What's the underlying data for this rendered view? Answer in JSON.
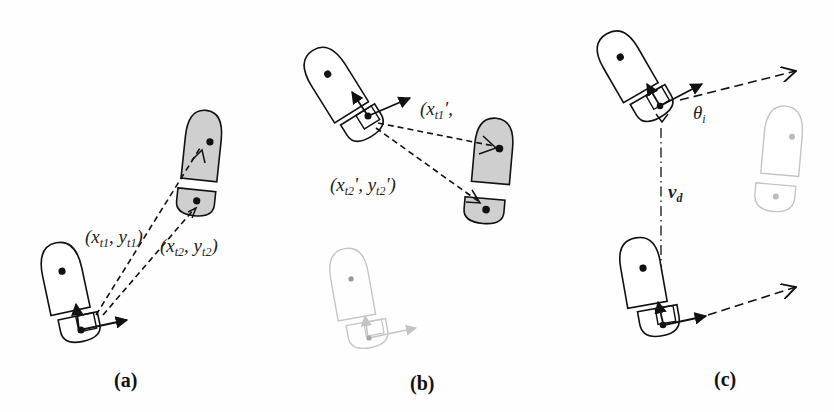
{
  "figure": {
    "panels": [
      {
        "id": "a",
        "caption": "(a)",
        "labels": [
          {
            "base": "(x",
            "sub1": "t1",
            "mid": ", y",
            "sub2": "t1",
            "end": ")"
          },
          {
            "base": "(x",
            "sub1": "t2",
            "mid": ", y",
            "sub2": "t2",
            "end": ")"
          }
        ]
      },
      {
        "id": "b",
        "caption": "(b)",
        "labels": [
          {
            "base": "(x",
            "sub1": "t1",
            "mid": "',",
            "sub2": "",
            "end": ""
          },
          {
            "base": "(x",
            "sub1": "t2",
            "mid": "', y",
            "sub2": "t2",
            "end": "')"
          }
        ]
      },
      {
        "id": "c",
        "caption": "(c)",
        "labels": [
          {
            "symbol": "θ",
            "sub": "i"
          },
          {
            "symbol": "v",
            "sub": "d"
          }
        ]
      }
    ],
    "colors": {
      "outline": "#111111",
      "footprint_fill": "#cfcfcf",
      "faded": "#bdbdbd",
      "background": "#ffffff"
    }
  }
}
